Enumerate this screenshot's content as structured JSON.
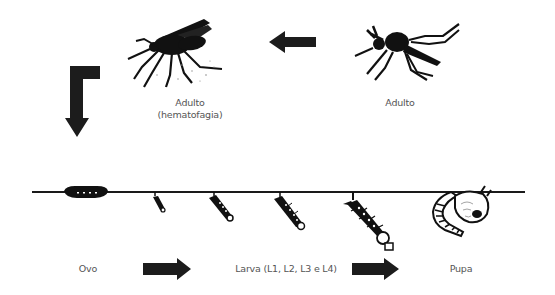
{
  "diagram": {
    "colors": {
      "background": "#ffffff",
      "ink": "#111111",
      "label": "#555555",
      "arrow": "#1c1c1c"
    },
    "stages": [
      {
        "id": "adult-feeding",
        "label_line1": "Adulto",
        "label_line2": "(hematofagia)"
      },
      {
        "id": "adult",
        "label": "Adulto"
      },
      {
        "id": "egg",
        "label": "Ovo"
      },
      {
        "id": "larva",
        "label": "Larva (L1, L2, L3 e L4)",
        "instars": [
          "L1",
          "L2",
          "L3",
          "L4"
        ]
      },
      {
        "id": "pupa",
        "label": "Pupa"
      }
    ],
    "arrows": [
      {
        "id": "adult-to-adult-feeding",
        "direction": "left"
      },
      {
        "id": "adult-feeding-to-egg",
        "direction": "down"
      },
      {
        "id": "egg-to-larva",
        "direction": "right"
      },
      {
        "id": "larva-to-pupa",
        "direction": "right"
      }
    ]
  }
}
